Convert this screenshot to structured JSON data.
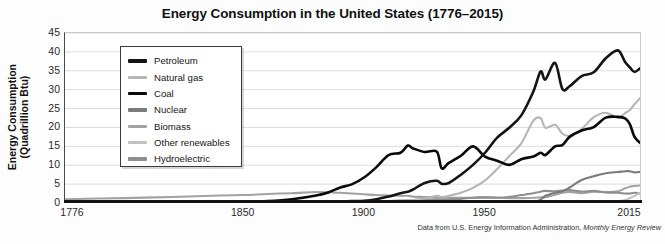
{
  "chart": {
    "title": "Energy Consumption in the United States (1776–2015)",
    "caption_prefix": "Data from U.S. Energy Information Administration, ",
    "caption_italic": "Monthly Energy Review"
  },
  "axes": {
    "ylabel_line1": "Energy Consumption",
    "ylabel_line2": "(Quadrillion Btu)",
    "yticks": [
      "45",
      "40",
      "35",
      "30",
      "25",
      "20",
      "15",
      "10",
      "5",
      "0"
    ],
    "xticks": [
      "1776",
      "1850",
      "1900",
      "1950",
      "2015"
    ]
  },
  "legend": {
    "items": [
      {
        "label": "Petroleum",
        "color": "#141414"
      },
      {
        "label": "Natural gas",
        "color": "#b5b5b5"
      },
      {
        "label": "Coal",
        "color": "#0a0a0a"
      },
      {
        "label": "Nuclear",
        "color": "#7b7b7b"
      },
      {
        "label": "Biomass",
        "color": "#a2a2a2"
      },
      {
        "label": "Other renewables",
        "color": "#c2c2c2"
      },
      {
        "label": "Hydroelectric",
        "color": "#8e8e8e"
      }
    ]
  },
  "chart_data": {
    "type": "line",
    "title": "Energy Consumption in the United States (1776–2015)",
    "xlabel": "",
    "ylabel": "Energy Consumption (Quadrillion Btu)",
    "xlim": [
      1776,
      2015
    ],
    "ylim": [
      0,
      45
    ],
    "ytick_step": 5,
    "grid": true,
    "legend_position": "upper-left-inside",
    "annotation": "Data from U.S. Energy Information Administration, Monthly Energy Review",
    "x": [
      1776,
      1800,
      1820,
      1840,
      1850,
      1860,
      1870,
      1880,
      1885,
      1890,
      1895,
      1900,
      1905,
      1910,
      1915,
      1918,
      1920,
      1925,
      1930,
      1932,
      1935,
      1940,
      1945,
      1950,
      1955,
      1960,
      1965,
      1970,
      1973,
      1975,
      1979,
      1982,
      1985,
      1990,
      1995,
      2000,
      2005,
      2008,
      2010,
      2012,
      2015
    ],
    "series": [
      {
        "name": "Petroleum",
        "color": "#141414",
        "values": [
          0,
          0,
          0,
          0,
          0,
          0,
          0.1,
          0.2,
          0.3,
          0.4,
          0.5,
          0.6,
          1.0,
          1.7,
          2.6,
          3.0,
          3.5,
          5.3,
          5.9,
          5.1,
          5.3,
          7.5,
          10.1,
          13.3,
          17.3,
          19.9,
          23.2,
          29.5,
          34.8,
          32.7,
          37.1,
          30.2,
          30.9,
          33.6,
          34.6,
          38.3,
          40.4,
          37.3,
          35.9,
          34.7,
          36.1
        ]
      },
      {
        "name": "Natural gas",
        "color": "#b5b5b5",
        "values": [
          0,
          0,
          0,
          0,
          0,
          0,
          0,
          0.1,
          0.15,
          0.25,
          0.25,
          0.25,
          0.4,
          0.5,
          0.7,
          0.8,
          0.8,
          1.2,
          1.9,
          1.6,
          1.9,
          2.7,
          4.0,
          6.0,
          9.0,
          12.4,
          15.8,
          21.8,
          22.5,
          19.9,
          20.7,
          18.4,
          17.8,
          19.6,
          22.7,
          23.9,
          22.6,
          23.8,
          24.6,
          26.2,
          28.3
        ]
      },
      {
        "name": "Coal",
        "color": "#0a0a0a",
        "values": [
          0,
          0.01,
          0.05,
          0.2,
          0.3,
          0.5,
          1.0,
          2.0,
          2.8,
          4.1,
          5.0,
          6.8,
          9.5,
          12.7,
          13.3,
          15.2,
          14.5,
          13.5,
          13.6,
          9.2,
          10.6,
          12.5,
          15.0,
          12.3,
          11.2,
          10.1,
          11.6,
          12.3,
          13.3,
          12.7,
          15.0,
          15.3,
          17.5,
          19.2,
          20.1,
          22.6,
          22.8,
          22.4,
          20.8,
          17.4,
          15.5
        ]
      },
      {
        "name": "Nuclear",
        "color": "#7b7b7b",
        "values": [
          0,
          0,
          0,
          0,
          0,
          0,
          0,
          0,
          0,
          0,
          0,
          0,
          0,
          0,
          0,
          0,
          0,
          0,
          0,
          0,
          0,
          0,
          0,
          0,
          0,
          0.04,
          0.04,
          0.24,
          0.91,
          1.9,
          2.7,
          3.1,
          4.1,
          6.1,
          7.1,
          7.9,
          8.2,
          8.4,
          8.4,
          8.1,
          8.3
        ]
      },
      {
        "name": "Biomass",
        "color": "#a2a2a2",
        "values": [
          1.0,
          1.3,
          1.6,
          2.0,
          2.1,
          2.4,
          2.6,
          2.9,
          2.8,
          2.7,
          2.5,
          2.3,
          2.1,
          2.0,
          1.9,
          1.9,
          1.7,
          1.6,
          1.5,
          1.4,
          1.4,
          1.4,
          1.4,
          1.6,
          1.4,
          1.3,
          1.3,
          1.4,
          1.5,
          1.5,
          2.2,
          2.7,
          2.9,
          2.6,
          3.0,
          2.9,
          3.1,
          3.9,
          4.3,
          4.5,
          4.7
        ]
      },
      {
        "name": "Other renewables",
        "color": "#c2c2c2",
        "values": [
          0,
          0,
          0,
          0,
          0,
          0,
          0,
          0,
          0,
          0,
          0,
          0,
          0,
          0,
          0,
          0,
          0,
          0,
          0,
          0,
          0,
          0,
          0,
          0,
          0,
          0,
          0,
          0,
          0,
          0.07,
          0.08,
          0.1,
          0.2,
          0.3,
          0.35,
          0.4,
          0.5,
          0.8,
          1.3,
          1.9,
          3.0
        ]
      },
      {
        "name": "Hydroelectric",
        "color": "#8e8e8e",
        "values": [
          0,
          0,
          0,
          0,
          0,
          0,
          0,
          0,
          0.02,
          0.05,
          0.1,
          0.25,
          0.4,
          0.5,
          0.6,
          0.7,
          0.8,
          0.9,
          1.0,
          0.9,
          1.0,
          1.1,
          1.4,
          1.4,
          1.4,
          1.6,
          2.1,
          2.6,
          3.0,
          3.2,
          3.1,
          3.3,
          3.4,
          3.0,
          3.2,
          2.8,
          2.7,
          2.5,
          2.5,
          2.7,
          2.4
        ]
      }
    ]
  }
}
